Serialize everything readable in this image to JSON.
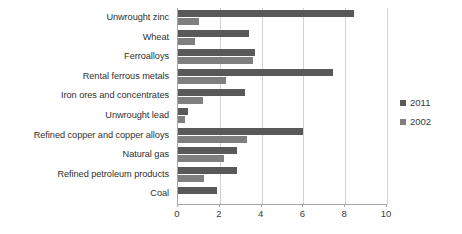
{
  "chart_data": {
    "type": "bar",
    "orientation": "horizontal",
    "title": "",
    "xlabel": "",
    "ylabel": "",
    "xlim": [
      0,
      10
    ],
    "xticks": [
      0,
      2,
      4,
      6,
      8,
      10
    ],
    "grid": true,
    "legend_position": "right",
    "categories": [
      "Unwrought zinc",
      "Wheat",
      "Ferroalloys",
      "Rental ferrous metals",
      "Iron ores and concentrates",
      "Unwrought lead",
      "Refined copper and copper alloys",
      "Natural gas",
      "Refined petroleum products",
      "Coal"
    ],
    "series": [
      {
        "name": "2011",
        "color": "#595959",
        "values": [
          8.4,
          3.4,
          3.7,
          7.4,
          3.2,
          0.5,
          6.0,
          2.8,
          2.8,
          1.85
        ]
      },
      {
        "name": "2002",
        "color": "#7f7f7f",
        "values": [
          1.0,
          0.8,
          3.6,
          2.3,
          1.2,
          0.35,
          3.3,
          2.2,
          1.25,
          0.0
        ]
      }
    ]
  },
  "legend": {
    "items": [
      {
        "label": "2011"
      },
      {
        "label": "2002"
      }
    ]
  },
  "colors": {
    "series_2011": "#595959",
    "series_2002": "#7f7f7f",
    "axis": "#a6a6a6",
    "gridline": "#d2d2d2",
    "background": "#ffffff"
  }
}
